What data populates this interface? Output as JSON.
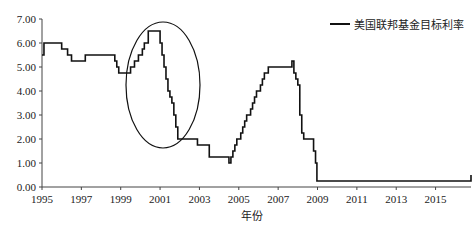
{
  "chart_data": {
    "type": "line",
    "title": "",
    "xlabel": "年份",
    "ylabel": "",
    "ylim": [
      0,
      7
    ],
    "xlim": [
      1995,
      2016.8
    ],
    "y_ticks": [
      "0.00",
      "1.00",
      "2.00",
      "3.00",
      "4.00",
      "5.00",
      "6.00",
      "7.00"
    ],
    "x_ticks": [
      "1995",
      "1997",
      "1999",
      "2001",
      "2003",
      "2005",
      "2007",
      "2009",
      "2011",
      "2013",
      "2015"
    ],
    "legend": {
      "position": "top-right",
      "entries": [
        "美国联邦基金目标利率"
      ]
    },
    "grid": false,
    "annotations": [
      {
        "type": "ellipse",
        "center_year": 2000.9,
        "center_value": 3.6,
        "note": "highlights 1999-2001 hike and cut"
      }
    ],
    "series": [
      {
        "name": "美国联邦基金目标利率",
        "step": true,
        "x": [
          1995.0,
          1995.1,
          1995.5,
          1996.0,
          1996.3,
          1996.5,
          1997.2,
          1998.7,
          1998.8,
          1998.9,
          1999.5,
          1999.7,
          1999.9,
          2000.1,
          2000.2,
          2000.4,
          2001.0,
          2001.1,
          2001.2,
          2001.3,
          2001.4,
          2001.5,
          2001.6,
          2001.7,
          2001.8,
          2001.9,
          2002.9,
          2003.5,
          2004.5,
          2004.6,
          2004.7,
          2004.8,
          2004.9,
          2005.1,
          2005.2,
          2005.3,
          2005.4,
          2005.6,
          2005.7,
          2005.8,
          2005.9,
          2006.1,
          2006.2,
          2006.3,
          2006.5,
          2007.7,
          2007.8,
          2007.9,
          2008.0,
          2008.1,
          2008.2,
          2008.3,
          2008.8,
          2008.9,
          2008.97,
          2015.95,
          2016.8
        ],
        "values": [
          5.5,
          6.0,
          6.0,
          5.75,
          5.5,
          5.25,
          5.5,
          5.25,
          5.0,
          4.75,
          5.0,
          5.25,
          5.5,
          5.75,
          6.0,
          6.5,
          6.0,
          5.5,
          5.0,
          4.5,
          4.0,
          3.75,
          3.5,
          3.0,
          2.5,
          2.0,
          1.75,
          1.25,
          1.0,
          1.25,
          1.5,
          1.75,
          2.0,
          2.25,
          2.5,
          2.75,
          3.0,
          3.25,
          3.5,
          3.75,
          4.0,
          4.25,
          4.5,
          4.75,
          5.0,
          5.25,
          4.75,
          4.5,
          4.25,
          3.0,
          2.25,
          2.0,
          1.5,
          1.0,
          0.25,
          0.25,
          0.5
        ]
      }
    ]
  }
}
